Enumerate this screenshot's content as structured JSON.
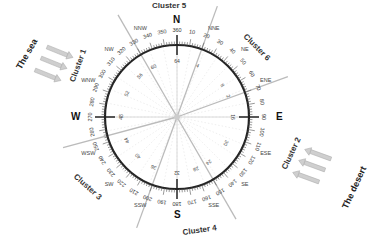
{
  "diagram": {
    "center": [
      177,
      117
    ],
    "ring_radius": 72,
    "cardinals": {
      "N": "N",
      "E": "E",
      "S": "S",
      "W": "W"
    },
    "intercardinals": [
      "NNE",
      "NE",
      "ENE",
      "ESE",
      "SE",
      "SSE",
      "SSW",
      "SW",
      "WSW",
      "WNW",
      "NW",
      "NNW"
    ],
    "intercardinal_angles": [
      22.5,
      45,
      67.5,
      112.5,
      135,
      157.5,
      202.5,
      225,
      247.5,
      292.5,
      315,
      337.5
    ],
    "degree_ticks": [
      360,
      10,
      20,
      30,
      40,
      50,
      60,
      70,
      80,
      90,
      100,
      110,
      120,
      130,
      140,
      150,
      160,
      170,
      180,
      190,
      200,
      210,
      220,
      230,
      240,
      250,
      260,
      270,
      280,
      290,
      300,
      310,
      320,
      330,
      340,
      350
    ],
    "inner_values": [
      {
        "angle": 0,
        "value": "64"
      },
      {
        "angle": 22,
        "value": "4"
      },
      {
        "angle": 55,
        "value": "8"
      },
      {
        "angle": 68,
        "value": "2"
      },
      {
        "angle": 90,
        "value": "16"
      },
      {
        "angle": 118,
        "value": "30"
      },
      {
        "angle": 145,
        "value": "24"
      },
      {
        "angle": 160,
        "value": "28"
      },
      {
        "angle": 180,
        "value": "32"
      },
      {
        "angle": 205,
        "value": "36"
      },
      {
        "angle": 225,
        "value": "40"
      },
      {
        "angle": 245,
        "value": "44"
      },
      {
        "angle": 270,
        "value": "48"
      },
      {
        "angle": 295,
        "value": "52"
      },
      {
        "angle": 318,
        "value": "56"
      },
      {
        "angle": 335,
        "value": "60"
      }
    ],
    "cluster_lines": [
      20,
      70,
      150,
      200,
      255,
      330
    ],
    "clusters": [
      {
        "name": "Cluster 1"
      },
      {
        "name": "Cluster 2"
      },
      {
        "name": "Cluster 3"
      },
      {
        "name": "Cluster 4"
      },
      {
        "name": "Cluster 5"
      },
      {
        "name": "Cluster 6"
      }
    ],
    "regions": {
      "sea": "The sea",
      "desert": "The desert"
    },
    "colors": {
      "ring": "#222222",
      "cluster_line": "#bbbbbb",
      "arrow": "#c8c8c8",
      "text": "#333333"
    }
  }
}
